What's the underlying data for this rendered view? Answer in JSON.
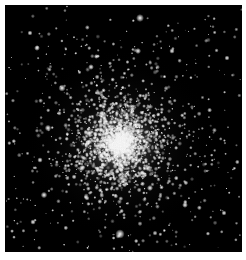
{
  "image": {
    "subject": "globular star cluster",
    "background_color": "#000000",
    "border_color": "#ffffff",
    "field": {
      "x": 5,
      "y": 5,
      "width": 237,
      "height": 247
    },
    "core": {
      "x": 115,
      "y": 138,
      "radius": 22
    },
    "halo_radius": 95,
    "cluster_star_count": 2600,
    "field_star_count": 260,
    "seed": 7,
    "bright_stars": [
      {
        "x": 140,
        "y": 18,
        "r": 2.2
      },
      {
        "x": 120,
        "y": 234,
        "r": 2.6
      },
      {
        "x": 62,
        "y": 88,
        "r": 2.0
      },
      {
        "x": 44,
        "y": 195,
        "r": 1.8
      },
      {
        "x": 48,
        "y": 128,
        "r": 1.8
      },
      {
        "x": 37,
        "y": 48,
        "r": 1.6
      },
      {
        "x": 138,
        "y": 51,
        "r": 1.7
      },
      {
        "x": 172,
        "y": 51,
        "r": 1.5
      },
      {
        "x": 91,
        "y": 67,
        "r": 1.6
      },
      {
        "x": 82,
        "y": 168,
        "r": 1.7
      },
      {
        "x": 150,
        "y": 188,
        "r": 1.7
      },
      {
        "x": 185,
        "y": 205,
        "r": 1.6
      },
      {
        "x": 40,
        "y": 160,
        "r": 1.5
      },
      {
        "x": 33,
        "y": 222,
        "r": 1.5
      },
      {
        "x": 224,
        "y": 213,
        "r": 1.4
      },
      {
        "x": 227,
        "y": 58,
        "r": 1.4
      },
      {
        "x": 30,
        "y": 33,
        "r": 1.4
      }
    ]
  }
}
